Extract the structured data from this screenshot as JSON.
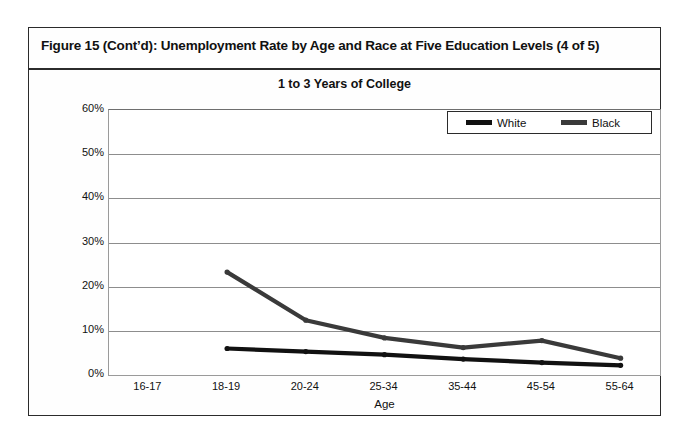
{
  "figure": {
    "title": "Figure 15 (Cont’d): Unemployment Rate by Age and Race at Five Education Levels (4 of 5)"
  },
  "chart_data": {
    "type": "line",
    "title": "1 to 3 Years of College",
    "xlabel": "Age",
    "ylabel": "",
    "categories": [
      "16-17",
      "18-19",
      "20-24",
      "25-34",
      "35-44",
      "45-54",
      "55-64"
    ],
    "ytick_labels": [
      "60%",
      "50%",
      "40%",
      "30%",
      "20%",
      "10%",
      "0%"
    ],
    "ytick_values": [
      60,
      50,
      40,
      30,
      20,
      10,
      0
    ],
    "ylim": [
      0,
      60
    ],
    "grid": true,
    "legend_position": "top-right",
    "series": [
      {
        "name": "White",
        "color": "#111111",
        "values": [
          null,
          6.0,
          5.3,
          4.6,
          3.6,
          2.8,
          2.2
        ]
      },
      {
        "name": "Black",
        "color": "#3a3a3a",
        "values": [
          null,
          23.3,
          12.4,
          8.4,
          6.2,
          7.8,
          3.8
        ]
      }
    ]
  },
  "legend": {
    "entries": [
      {
        "label": "White"
      },
      {
        "label": "Black"
      }
    ]
  }
}
